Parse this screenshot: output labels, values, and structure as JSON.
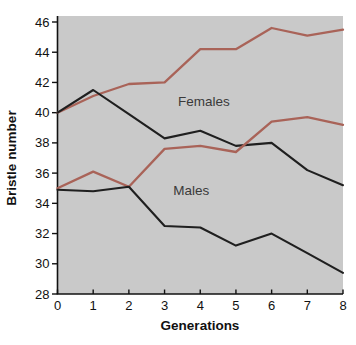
{
  "figure": {
    "background": "#ffffff",
    "plot_background": "#c9c9c9",
    "axis_color": "#111111",
    "tick_label_color": "#111111"
  },
  "chart_data": {
    "type": "line",
    "xlabel": "Generations",
    "ylabel": "Bristle number",
    "x": [
      0,
      1,
      2,
      3,
      4,
      5,
      6,
      7,
      8
    ],
    "x_ticks": [
      "0",
      "1",
      "2",
      "3",
      "4",
      "5",
      "6",
      "7",
      "8"
    ],
    "y_ticks": [
      "28",
      "30",
      "32",
      "34",
      "36",
      "38",
      "40",
      "42",
      "44",
      "46"
    ],
    "xlim": [
      0,
      8
    ],
    "ylim": [
      28,
      46
    ],
    "grid": false,
    "legend_position": "none",
    "annotations": [
      {
        "text": "Females",
        "x": 4.1,
        "y": 40.8
      },
      {
        "text": "Males",
        "x": 3.75,
        "y": 34.9
      }
    ],
    "series": [
      {
        "name": "females-high-selection",
        "color": "#a96358",
        "values": [
          40.0,
          41.1,
          41.9,
          42.0,
          44.2,
          44.2,
          45.6,
          45.1,
          45.5
        ]
      },
      {
        "name": "females-low-selection",
        "color": "#1f1f1f",
        "values": [
          40.0,
          41.5,
          39.9,
          38.3,
          38.8,
          37.8,
          38.0,
          36.2,
          35.2
        ]
      },
      {
        "name": "males-high-selection",
        "color": "#a96358",
        "values": [
          35.0,
          36.1,
          35.1,
          37.6,
          37.8,
          37.4,
          39.4,
          39.7,
          39.2
        ]
      },
      {
        "name": "males-low-selection",
        "color": "#1f1f1f",
        "values": [
          34.9,
          34.8,
          35.1,
          32.5,
          32.4,
          31.2,
          32.0,
          30.7,
          29.4
        ]
      }
    ]
  }
}
